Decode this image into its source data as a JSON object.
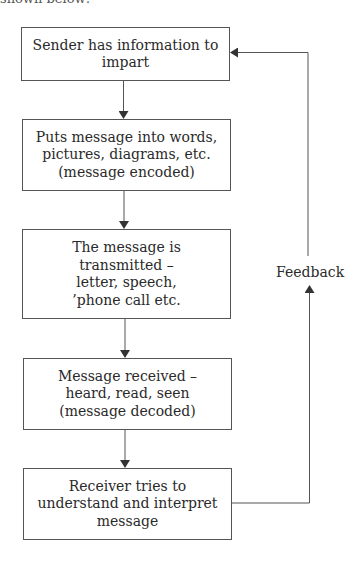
{
  "page": {
    "top_fragment": "shown below:"
  },
  "diagram": {
    "steps": [
      {
        "id": "sender",
        "label": "Sender has information to\nimpart"
      },
      {
        "id": "encode",
        "label": "Puts message into words,\npictures, diagrams, etc.\n(message encoded)"
      },
      {
        "id": "transmit",
        "label": "The message is\ntransmitted –\nletter, speech,\n’phone call etc."
      },
      {
        "id": "receive",
        "label": "Message received –\nheard, read, seen\n(message decoded)"
      },
      {
        "id": "interpret",
        "label": "Receiver tries to\nunderstand and interpret\nmessage"
      }
    ],
    "feedback_label": "Feedback",
    "edges": [
      {
        "from": "sender",
        "to": "encode"
      },
      {
        "from": "encode",
        "to": "transmit"
      },
      {
        "from": "transmit",
        "to": "receive"
      },
      {
        "from": "receive",
        "to": "interpret"
      },
      {
        "from": "interpret",
        "to": "sender",
        "label": "Feedback"
      }
    ],
    "colors": {
      "line": "#555555",
      "text": "#2a2a2a",
      "background": "#ffffff"
    }
  }
}
